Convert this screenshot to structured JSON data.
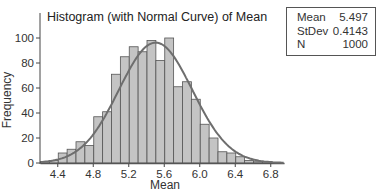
{
  "chart_data": {
    "type": "bar",
    "subtype": "histogram_with_normal_curve",
    "title": "Histogram (with Normal Curve) of Mean",
    "xlabel": "Mean",
    "ylabel": "Frequency",
    "x_ticks": [
      "4.4",
      "4.8",
      "5.2",
      "5.6",
      "6.0",
      "6.4",
      "6.8"
    ],
    "y_ticks": [
      "0",
      "20",
      "40",
      "60",
      "80",
      "100"
    ],
    "xlim": [
      4.2,
      7.0
    ],
    "ylim": [
      0,
      110
    ],
    "bin_width": 0.1,
    "bin_starts": [
      4.2,
      4.3,
      4.4,
      4.5,
      4.6,
      4.7,
      4.8,
      4.9,
      5.0,
      5.1,
      5.2,
      5.3,
      5.4,
      5.5,
      5.6,
      5.7,
      5.8,
      5.9,
      6.0,
      6.1,
      6.2,
      6.3,
      6.4,
      6.5,
      6.6,
      6.7
    ],
    "values": [
      1,
      2,
      8,
      11,
      17,
      14,
      37,
      41,
      71,
      85,
      93,
      89,
      98,
      82,
      100,
      61,
      65,
      51,
      31,
      20,
      9,
      8,
      5,
      2,
      1,
      1
    ],
    "normal_curve": {
      "mean": 5.497,
      "stdev": 0.4143,
      "n": 1000
    },
    "grid": false,
    "legend_position": "top-right stats box"
  },
  "stats_box": {
    "rows": [
      {
        "label": "Mean",
        "value": "5.497"
      },
      {
        "label": "StDev",
        "value": "0.4143"
      },
      {
        "label": "N",
        "value": "1000"
      }
    ]
  },
  "colors": {
    "bar_fill": "#c4c4c4",
    "bar_stroke": "#555555",
    "curve": "#6e6e6e",
    "axis": "#444444"
  }
}
